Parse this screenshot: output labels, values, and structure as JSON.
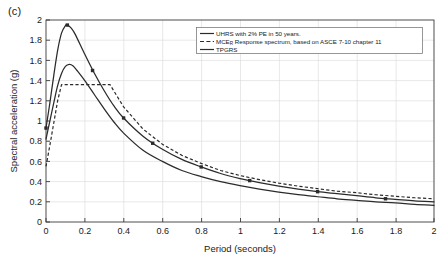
{
  "panel": {
    "label": "(c)"
  },
  "chart_data": {
    "type": "line",
    "title": "",
    "xlabel": "Period (seconds)",
    "ylabel": "Spectral acceleration (g)",
    "xlim": [
      0,
      2
    ],
    "ylim": [
      0,
      2
    ],
    "xticks": [
      0,
      0.2,
      0.4,
      0.6,
      0.8,
      1,
      1.2,
      1.4,
      1.6,
      1.8,
      2
    ],
    "xtick_labels": [
      "0",
      "0.2",
      "0.4",
      "0.6",
      "0.8",
      "1",
      "1.2",
      "1.4",
      "1.6",
      "1.8",
      "2"
    ],
    "yticks": [
      0,
      0.2,
      0.4,
      0.6,
      0.8,
      1,
      1.2,
      1.4,
      1.6,
      1.8,
      2
    ],
    "ytick_labels": [
      "0",
      "0.2",
      "0.4",
      "0.6",
      "0.8",
      "1",
      "1.2",
      "1.4",
      "1.6",
      "1.8",
      "2"
    ],
    "grid": true,
    "legend_position": "top-right",
    "series": [
      {
        "name": "UHRS with 2% PE in 50 years",
        "style": "solid",
        "marker": "square",
        "x": [
          0,
          0.02,
          0.04,
          0.06,
          0.08,
          0.1,
          0.11,
          0.13,
          0.15,
          0.2,
          0.25,
          0.3,
          0.35,
          0.4,
          0.5,
          0.6,
          0.7,
          0.8,
          0.9,
          1.0,
          1.1,
          1.2,
          1.3,
          1.4,
          1.5,
          1.6,
          1.7,
          1.8,
          1.9,
          2.0
        ],
        "y": [
          0.93,
          1.18,
          1.45,
          1.7,
          1.87,
          1.945,
          1.95,
          1.92,
          1.86,
          1.66,
          1.47,
          1.3,
          1.15,
          1.03,
          0.85,
          0.72,
          0.62,
          0.545,
          0.48,
          0.43,
          0.39,
          0.355,
          0.325,
          0.3,
          0.28,
          0.26,
          0.24,
          0.225,
          0.21,
          0.2
        ],
        "marker_points": [
          [
            0.0,
            0.93
          ],
          [
            0.11,
            1.95
          ],
          [
            0.24,
            1.5
          ],
          [
            0.4,
            1.03
          ],
          [
            0.55,
            0.78
          ],
          [
            0.8,
            0.545
          ],
          [
            1.05,
            0.41
          ],
          [
            1.4,
            0.3
          ],
          [
            1.75,
            0.23
          ]
        ]
      },
      {
        "name": "MCE_R Response spectrum, based on ASCE 7-10 chapter 11",
        "style": "dashed",
        "marker": "none",
        "x": [
          0,
          0.02,
          0.04,
          0.06,
          0.08,
          0.33,
          0.4,
          0.5,
          0.6,
          0.7,
          0.8,
          0.9,
          1.0,
          1.1,
          1.2,
          1.3,
          1.4,
          1.5,
          1.6,
          1.7,
          1.8,
          1.9,
          2.0
        ],
        "y": [
          0.55,
          0.76,
          0.98,
          1.2,
          1.36,
          1.36,
          1.14,
          0.92,
          0.77,
          0.66,
          0.58,
          0.51,
          0.46,
          0.42,
          0.385,
          0.355,
          0.33,
          0.305,
          0.29,
          0.27,
          0.255,
          0.24,
          0.23
        ],
        "plateau_value": 1.36,
        "plateau_range": [
          0.08,
          0.33
        ]
      },
      {
        "name": "TPGRS",
        "style": "solid",
        "marker": "none",
        "x": [
          0,
          0.02,
          0.04,
          0.06,
          0.08,
          0.1,
          0.12,
          0.14,
          0.16,
          0.2,
          0.25,
          0.3,
          0.35,
          0.4,
          0.5,
          0.6,
          0.7,
          0.8,
          0.9,
          1.0,
          1.1,
          1.2,
          1.3,
          1.4,
          1.5,
          1.6,
          1.7,
          1.8,
          1.9,
          2.0
        ],
        "y": [
          0.82,
          1.0,
          1.18,
          1.35,
          1.47,
          1.54,
          1.56,
          1.545,
          1.5,
          1.4,
          1.26,
          1.12,
          0.99,
          0.88,
          0.71,
          0.6,
          0.51,
          0.45,
          0.4,
          0.36,
          0.325,
          0.295,
          0.27,
          0.25,
          0.23,
          0.215,
          0.2,
          0.19,
          0.175,
          0.165
        ]
      }
    ],
    "legend": [
      {
        "label": "UHRS with 2% PE in 50 years.",
        "style": "solid",
        "marker": "none"
      },
      {
        "label_pre": "MCE",
        "label_sub": "R",
        "label_post": " Response spectrum, based on ASCE 7-10 chapter 11",
        "style": "dashed",
        "marker": "none"
      },
      {
        "label": "TPGRS",
        "style": "solid",
        "marker": "none"
      }
    ]
  }
}
